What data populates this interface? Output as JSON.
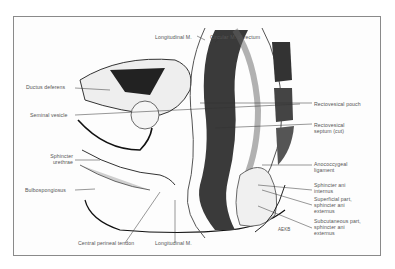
{
  "figure": {
    "signature": "AEKB"
  },
  "labels": {
    "longitudinal_m_top": "Longitudinal M.",
    "circular_m_rectum": "Circular M. of rectum",
    "ductus_deferens": "Ductus deferens",
    "seminal_vesicle": "Seminal vesicle",
    "sphincter_urethrae_1": "Sphincter",
    "sphincter_urethrae_2": "urethrae",
    "bulbospongiosus": "Bulbospongiosus",
    "central_perineal_tendon": "Central perineal tendon",
    "longitudinal_m_bottom": "Longitudinal M.",
    "rectovesical_pouch": "Rectovesical pouch",
    "rectovesical_septum_1": "Rectovesical",
    "rectovesical_septum_2": "septum (cut)",
    "anococcygeal_1": "Anococcygeal",
    "anococcygeal_2": "ligament",
    "sphincter_ani_internus_1": "Sphincter ani",
    "sphincter_ani_internus_2": "internus",
    "superficial_part_1": "Superficial part,",
    "superficial_part_2": "sphincter ani",
    "superficial_part_3": "externus",
    "subcutaneous_part_1": "Subcutaneous part,",
    "subcutaneous_part_2": "sphincter ani",
    "subcutaneous_part_3": "externus"
  }
}
